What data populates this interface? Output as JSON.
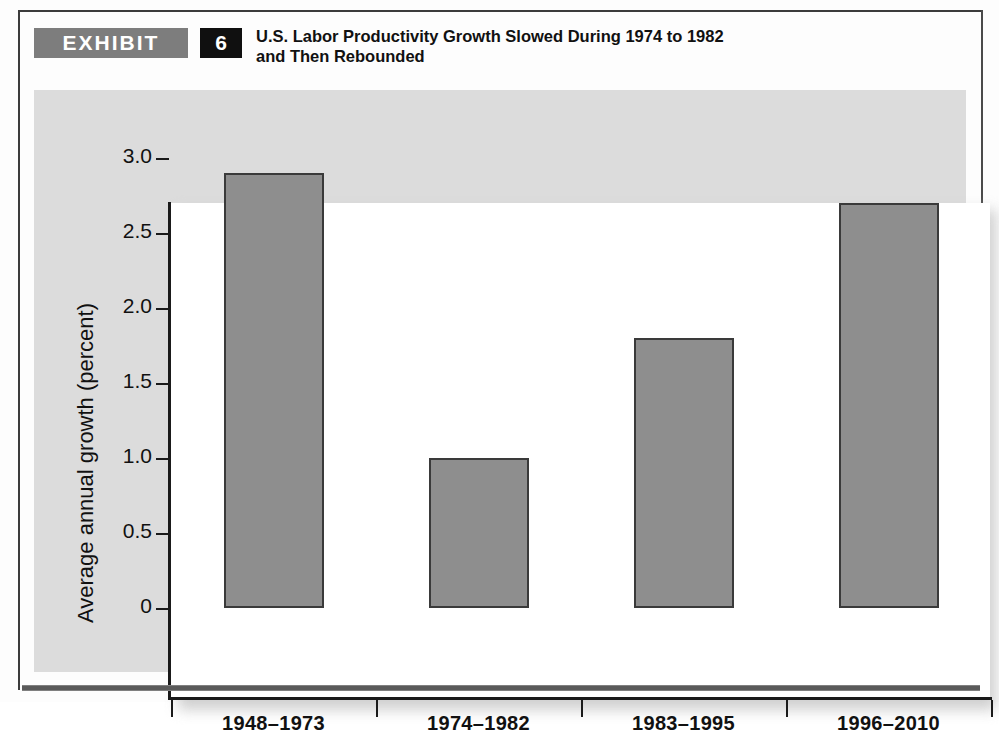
{
  "exhibit": {
    "tag_label": "EXHIBIT",
    "number": "6",
    "title_line1": "U.S. Labor Productivity Growth Slowed During 1974 to 1982",
    "title_line2": "and Then Rebounded"
  },
  "colors": {
    "bar_fill": "#8e8e8e",
    "bar_stroke": "#3a3a3a",
    "panel_bg": "#dcdcdc",
    "tag_bg": "#7d7d7d",
    "number_bg": "#101010",
    "axis": "#1a1a1a"
  },
  "chart_data": {
    "type": "bar",
    "title": "U.S. Labor Productivity Growth Slowed During 1974 to 1982 and Then Rebounded",
    "xlabel": "",
    "ylabel": "Average annual growth (percent)",
    "categories": [
      "1948–1973",
      "1974–1982",
      "1983–1995",
      "1996–2010"
    ],
    "values": [
      2.9,
      1.0,
      1.8,
      2.7
    ],
    "ylim": [
      0,
      3.3
    ],
    "ytick_values": [
      0,
      0.5,
      1.0,
      1.5,
      2.0,
      2.5,
      3.0
    ],
    "ytick_labels": [
      "0",
      "0.5",
      "1.0",
      "1.5",
      "2.0",
      "2.5",
      "3.0"
    ],
    "grid": false,
    "legend": false,
    "series": [
      {
        "name": "Average annual labor productivity growth",
        "values": [
          2.9,
          1.0,
          1.8,
          2.7
        ]
      }
    ]
  }
}
